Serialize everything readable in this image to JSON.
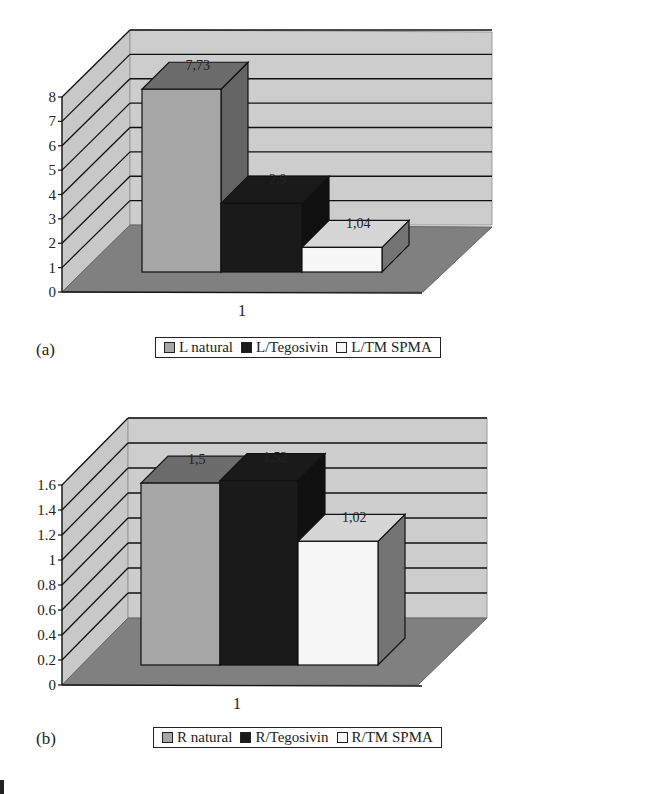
{
  "figure": {
    "panels": [
      {
        "id": "a",
        "panel_label": "(a)",
        "x_category": "1",
        "y_ticks": [
          "0",
          "1",
          "2",
          "3",
          "4",
          "5",
          "6",
          "7",
          "8"
        ],
        "legend": [
          {
            "label": "L natural",
            "color": "#a6a6a6"
          },
          {
            "label": "L/Tegosivin",
            "color": "#1a1a1a"
          },
          {
            "label": "L/TM SPMA",
            "color": "#f7f7f7"
          }
        ],
        "data_labels": [
          "7,73",
          "2,9",
          "1,04"
        ]
      },
      {
        "id": "b",
        "panel_label": "(b)",
        "x_category": "1",
        "y_ticks": [
          "0",
          "0.2",
          "0.4",
          "0.6",
          "0.8",
          "1",
          "1.2",
          "1.4",
          "1.6"
        ],
        "legend": [
          {
            "label": "R natural",
            "color": "#a6a6a6"
          },
          {
            "label": "R/Tegosivin",
            "color": "#1a1a1a"
          },
          {
            "label": "R/TM SPMA",
            "color": "#f7f7f7"
          }
        ],
        "data_labels": [
          "1,5",
          "1,52",
          "1,02"
        ]
      }
    ],
    "colors": {
      "wall": "#c8c8c8",
      "floor": "#808080",
      "grid": "#111111",
      "natural": "#a6a6a6",
      "tegosivin": "#1a1a1a",
      "tmspma": "#f7f7f7"
    }
  },
  "chart_data": [
    {
      "type": "bar",
      "title": "",
      "panel": "(a)",
      "categories": [
        "1"
      ],
      "series": [
        {
          "name": "L natural",
          "values": [
            7.73
          ]
        },
        {
          "name": "L/Tegosivin",
          "values": [
            2.9
          ]
        },
        {
          "name": "L/TM SPMA",
          "values": [
            1.04
          ]
        }
      ],
      "xlabel": "",
      "ylabel": "",
      "ylim": [
        0,
        8
      ],
      "yticks": [
        0,
        1,
        2,
        3,
        4,
        5,
        6,
        7,
        8
      ],
      "grid": true,
      "style": "3d-clustered-column",
      "legend_position": "bottom"
    },
    {
      "type": "bar",
      "title": "",
      "panel": "(b)",
      "categories": [
        "1"
      ],
      "series": [
        {
          "name": "R natural",
          "values": [
            1.5
          ]
        },
        {
          "name": "R/Tegosivin",
          "values": [
            1.52
          ]
        },
        {
          "name": "R/TM SPMA",
          "values": [
            1.02
          ]
        }
      ],
      "xlabel": "",
      "ylabel": "",
      "ylim": [
        0,
        1.6
      ],
      "yticks": [
        0,
        0.2,
        0.4,
        0.6,
        0.8,
        1.0,
        1.2,
        1.4,
        1.6
      ],
      "grid": true,
      "style": "3d-clustered-column",
      "legend_position": "bottom"
    }
  ]
}
